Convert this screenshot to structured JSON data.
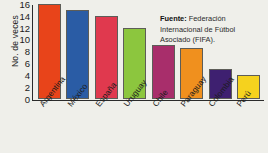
{
  "chart_data": {
    "type": "bar",
    "title": "",
    "xlabel": "",
    "ylabel": "No. de veces",
    "ylim": [
      0,
      16
    ],
    "yticks": [
      0,
      2,
      4,
      6,
      8,
      10,
      12,
      14,
      16
    ],
    "grid": false,
    "legend": null,
    "categories": [
      "Argentina",
      "México",
      "España",
      "Uruguay",
      "Chile",
      "Paraguay",
      "Colombia",
      "Perú"
    ],
    "values": [
      16,
      15,
      14,
      12,
      9,
      8.5,
      5,
      4
    ],
    "bar_colors": [
      "#E8441A",
      "#2A5CA5",
      "#E0394E",
      "#8CC63E",
      "#A82E6B",
      "#F0901E",
      "#3E2070",
      "#F5D21E"
    ],
    "annotations": [
      {
        "name": "source-note",
        "label": "Fuente:",
        "text": " Federación Internacional de Fútbol Asociado (FIFA)."
      }
    ]
  },
  "source": {
    "label": "Fuente:",
    "text": " Federación Internacional de Fútbol Asociado (FIFA)."
  },
  "colors": {
    "background": "#efefea",
    "axis": "#2b2b2b",
    "text": "#1b1b1b"
  }
}
